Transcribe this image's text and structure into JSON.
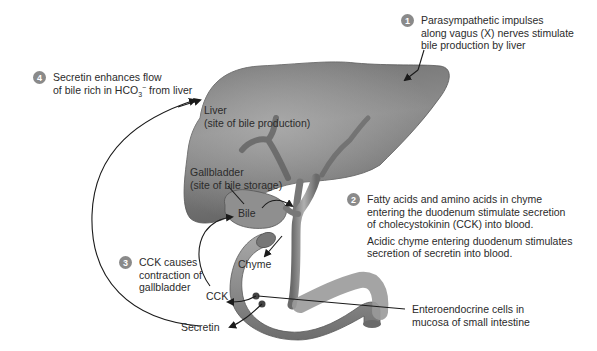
{
  "steps": [
    {
      "number": "1",
      "lines": [
        "Parasympathetic impulses",
        "along vagus (X) nerves stimulate",
        "bile production by liver"
      ]
    },
    {
      "number": "2",
      "lines": [
        "Fatty acids and amino acids in chyme",
        "entering the duodenum stimulate secretion",
        "of cholecystokinin (CCK) into blood."
      ],
      "extra_lines": [
        "Acidic chyme entering duodenum stimulates",
        "secretion of secretin into blood."
      ]
    },
    {
      "number": "3",
      "lines": [
        "CCK causes",
        "contraction of",
        "gallbladder"
      ]
    },
    {
      "number": "4",
      "line1": "Secretin enhances flow",
      "line2_prefix": "of bile rich in HCO",
      "line2_sub": "3",
      "line2_sup": "−",
      "line2_suffix": " from liver"
    }
  ],
  "labels": {
    "liver": [
      "Liver",
      "(site of bile production)"
    ],
    "gallbladder": [
      "Gallbladder",
      "(site of bile storage)"
    ],
    "bile": "Bile",
    "chyme": "Chyme",
    "cck": "CCK",
    "secretin": "Secretin",
    "enteroendocrine": [
      "Enteroendocrine cells in",
      "mucosa of small intestine"
    ]
  },
  "colors": {
    "organ_fill": "#7b7b7b",
    "organ_light": "#a9a9a9",
    "organ_dark": "#4e4e4e",
    "badge": "#8a8a8a",
    "text": "#2b2b2b"
  }
}
